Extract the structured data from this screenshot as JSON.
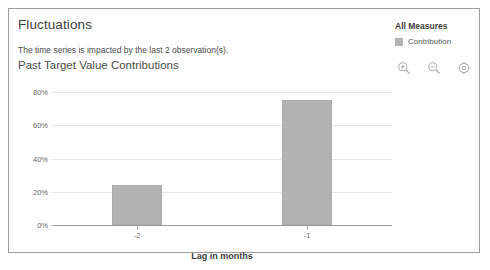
{
  "panel": {
    "title": "Fluctuations",
    "subtitle": "The time series is impacted by the last 2 observation(s)."
  },
  "toolbar": {
    "zoom_in_label": "zoom-in",
    "zoom_out_label": "zoom-out",
    "settings_label": "settings"
  },
  "legend": {
    "title": "All Measures",
    "items": [
      {
        "label": "Contribution",
        "color": "#b3b3b3"
      }
    ]
  },
  "chart_data": {
    "type": "bar",
    "title": "Past Target Value Contributions",
    "xlabel": "Lag in months",
    "ylabel": "",
    "categories": [
      "-2",
      "-1"
    ],
    "values": [
      24,
      75
    ],
    "series": [
      {
        "name": "Contribution",
        "values": [
          24,
          75
        ],
        "color": "#b3b3b3"
      }
    ],
    "ylim": [
      0,
      85
    ],
    "yticks": [
      0,
      20,
      40,
      60,
      80
    ],
    "ytick_labels": [
      "0%",
      "20%",
      "40%",
      "60%",
      "80%"
    ],
    "grid": true,
    "legend_position": "right"
  }
}
